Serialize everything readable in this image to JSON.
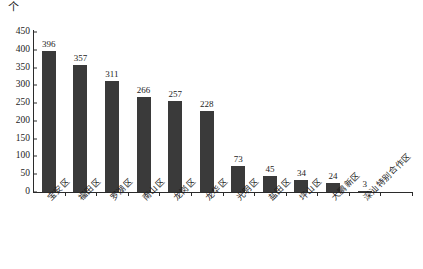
{
  "chart_data": {
    "type": "bar",
    "title": "",
    "subtitle": "",
    "unit_label": "个",
    "xlabel": "",
    "ylabel": "",
    "ylim": [
      0,
      450
    ],
    "ytick_step": 50,
    "yticks": [
      0,
      50,
      100,
      150,
      200,
      250,
      300,
      350,
      400,
      450
    ],
    "grid": false,
    "legend": false,
    "legend_position": "none",
    "bar_color": "#3a3a3a",
    "axis_color": "#2b2b2b",
    "background": "#ffffff",
    "data_labels_shown": true,
    "label_rotation_deg": -45,
    "categories": [
      "宝安区",
      "福田区",
      "罗湖区",
      "南山区",
      "龙岗区",
      "龙华区",
      "光明区",
      "盐田区",
      "坪山区",
      "大鹏新区",
      "深汕特别合作区"
    ],
    "values": [
      396,
      357,
      311,
      266,
      257,
      228,
      73,
      45,
      34,
      24,
      3
    ]
  }
}
